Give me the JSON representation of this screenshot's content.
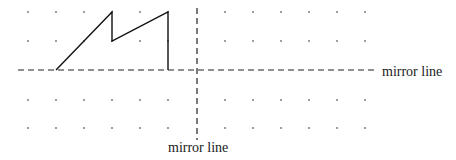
{
  "diagram": {
    "grid": {
      "dot_color": "#888888",
      "columns_x": [
        28,
        56,
        84,
        112,
        140,
        168,
        225,
        253,
        281,
        309,
        337,
        365
      ],
      "rows_y": [
        12,
        41,
        100,
        128
      ],
      "dot_radius": 1.1
    },
    "mirror_lines": {
      "horizontal": {
        "y": 70,
        "x1": 18,
        "x2": 378,
        "label": "mirror line"
      },
      "vertical": {
        "x": 197,
        "y1": 8,
        "y2": 140,
        "label": "mirror line"
      }
    },
    "shape": {
      "stroke": "#111111",
      "points": [
        [
          56,
          70
        ],
        [
          112,
          12
        ],
        [
          112,
          41
        ],
        [
          168,
          12
        ],
        [
          168,
          70
        ]
      ]
    },
    "labels": {
      "horizontal_mirror_label": "mirror line",
      "vertical_mirror_label": "mirror line"
    }
  }
}
